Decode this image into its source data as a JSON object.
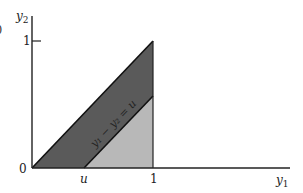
{
  "diagram": {
    "axes": {
      "x_label": "y",
      "x_label_sub": "1",
      "y_label": "y",
      "y_label_sub": "2",
      "origin_label": "0"
    },
    "ticks": {
      "x": [
        {
          "label": "u",
          "value": "u"
        },
        {
          "label": "1",
          "value": 1
        }
      ],
      "y": [
        {
          "label": "1",
          "value": 1
        }
      ]
    },
    "line_label": "y₁ − y₂ = u",
    "regions": [
      {
        "name": "dark-band",
        "description": "region between y2 = y1 and y2 = y1 - u, for 0 ≤ y1 ≤ 1",
        "color": "#5a5a5a"
      },
      {
        "name": "light-triangle",
        "description": "region below y2 = y1 - u, for u ≤ y1 ≤ 1",
        "color": "#b8b8b8"
      }
    ],
    "partial_left_glyph": ")"
  }
}
